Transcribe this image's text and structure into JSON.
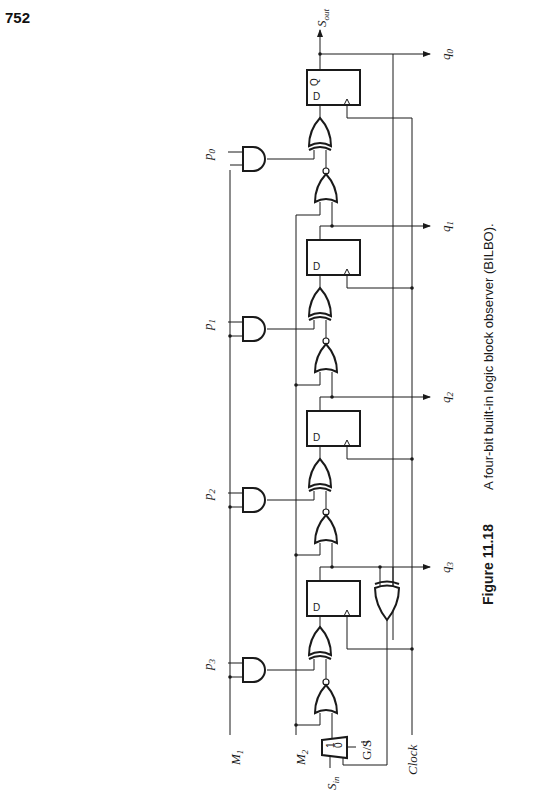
{
  "page": {
    "number": "752"
  },
  "figure": {
    "label": "Figure 11.18",
    "caption": "A four-bit built-in logic block observer (BILBO)."
  },
  "signals": {
    "s_out": "S",
    "s_out_sub": "out",
    "s_in": "S",
    "s_in_sub": "in",
    "m1": "M",
    "m1_sub": "1",
    "m2": "M",
    "m2_sub": "2",
    "clock": "Clock",
    "gs": "G/S",
    "q": [
      {
        "base": "q",
        "sub": "0"
      },
      {
        "base": "q",
        "sub": "1"
      },
      {
        "base": "q",
        "sub": "2"
      },
      {
        "base": "q",
        "sub": "3"
      }
    ],
    "p": [
      {
        "base": "p",
        "sub": "0"
      },
      {
        "base": "p",
        "sub": "1"
      },
      {
        "base": "p",
        "sub": "2"
      },
      {
        "base": "p",
        "sub": "3"
      }
    ]
  },
  "flipflop": {
    "d": "D",
    "q": "Q",
    "qbar": "Q"
  },
  "mux": {
    "in1": "1",
    "in0": "0"
  }
}
